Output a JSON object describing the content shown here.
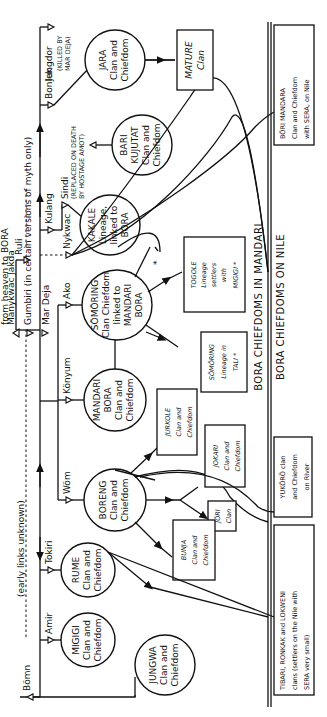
{
  "diagram": {
    "title_top": "BORA CHIEFDOMS IN MANDARI",
    "title_bottom": "BORA CHIEFDOMS ON NILE",
    "orientation": "rotated 90° counter-clockwise",
    "annotations": {
      "heaven": "from heaven to BORA",
      "myth": "Gumbiri (in certain versions of myth only)",
      "early": "(early links unknown)",
      "jungdor_note_1": "(KILLED BY",
      "jungdor_note_2": "MAR DEJA)",
      "sindi_note_1": "(REPLACED ON DEATH",
      "sindi_note_2": "BY HOSTAGE AMOT)"
    },
    "ancestors": [
      {
        "name": "Manykwac Jakda"
      },
      {
        "name": "Ruli"
      },
      {
        "name": "Gumbiri"
      },
      {
        "name": "Mar Deja"
      },
      {
        "name": "Bömn"
      },
      {
        "name": "Amir"
      },
      {
        "name": "Tokiri"
      },
      {
        "name": "Wöm"
      },
      {
        "name": "Könyum"
      },
      {
        "name": "Ako"
      },
      {
        "name": "Nykwac"
      },
      {
        "name": "Kulang"
      },
      {
        "name": "Sindi"
      },
      {
        "name": "Bonlek"
      },
      {
        "name": "Jungdor"
      }
    ],
    "circles": [
      {
        "id": "jara",
        "lines": [
          "JARA",
          "Clan and",
          "Chiefdom"
        ]
      },
      {
        "id": "bari",
        "lines": [
          "BARI",
          "KUJUTAT",
          "Clan and",
          "Chiefdom"
        ]
      },
      {
        "id": "kakale",
        "lines": [
          "KAKALE",
          "Lineage,",
          "linked to",
          "BORA"
        ]
      },
      {
        "id": "somoring",
        "lines": [
          "SÖMÖRING",
          "Clan Chiefdom",
          "linked to",
          "MANDARI",
          "BORA"
        ]
      },
      {
        "id": "mandari_bora",
        "lines": [
          "MANDARI",
          "BORA",
          "Clan and",
          "Chiefdom"
        ]
      },
      {
        "id": "boreng",
        "lines": [
          "BORENG",
          "Clan and",
          "Chiefdom"
        ]
      },
      {
        "id": "rume",
        "lines": [
          "RUME",
          "Clan and",
          "Chiefdom"
        ]
      },
      {
        "id": "migigi",
        "lines": [
          "MIGIGI",
          "Clan and",
          "Chiefdom"
        ]
      },
      {
        "id": "jungwa",
        "lines": [
          "JUNGWA",
          "Clan and",
          "Chiefdom"
        ]
      }
    ],
    "boxes": [
      {
        "id": "mature",
        "lines": [
          "MATURE",
          "Clan"
        ]
      },
      {
        "id": "togole",
        "lines": [
          "TOGOLE",
          "Lineage",
          "settlers",
          "with",
          "MIGIGI *"
        ]
      },
      {
        "id": "somoring_tali",
        "lines": [
          "SÖMÖRING",
          "Lineage in",
          "TALI *"
        ]
      },
      {
        "id": "jurkole",
        "lines": [
          "JURKOLE",
          "Clan and",
          "Chiefdom"
        ]
      },
      {
        "id": "jokari",
        "lines": [
          "JOKARI",
          "Clan and",
          "Chiefdom"
        ]
      },
      {
        "id": "jori",
        "lines": [
          "JÖRI",
          "Clan"
        ]
      },
      {
        "id": "bunja",
        "lines": [
          "BUNJA",
          "Clan and",
          "Chiefdom"
        ]
      }
    ],
    "nile_boxes": [
      {
        "id": "bori_mandara",
        "lines": [
          "BÖRI     MANDARA",
          "Clan  and  Chiefdom",
          "with  SERA,  on  Nile"
        ]
      },
      {
        "id": "yukoro",
        "lines": [
          "YUKÖRÖ  clan",
          "and Chiefdom",
          "on  River"
        ]
      },
      {
        "id": "tibari",
        "lines": [
          "TIBARI, RONKAK and LOKWENI",
          "clans (settlers on the Nile with",
          "SERA  very  small)"
        ]
      }
    ],
    "asterisk": "*"
  }
}
